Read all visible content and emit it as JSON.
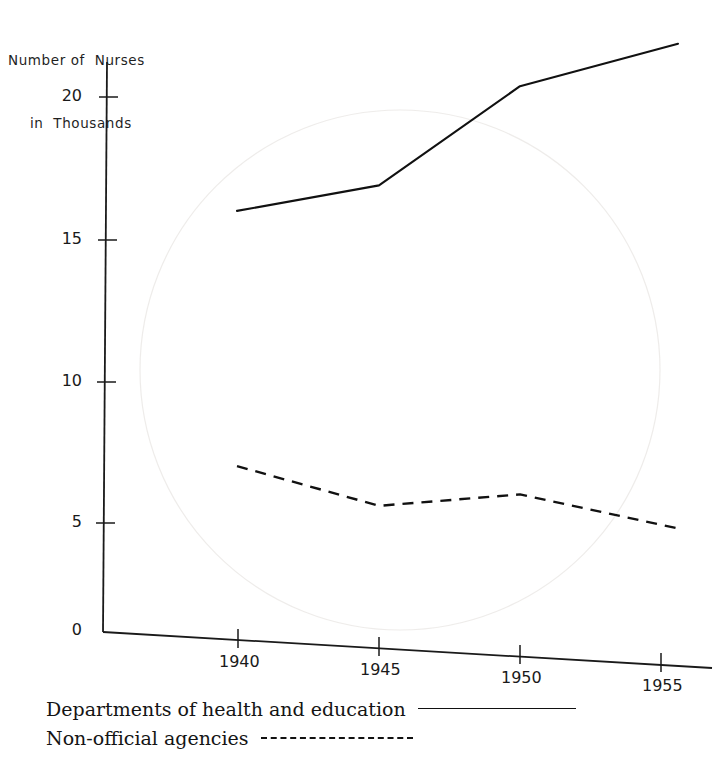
{
  "chart_data": {
    "type": "line",
    "title": "Number of Nurses in Thousands",
    "title_line1": "Number of  Nurses",
    "title_line2": "in  Thousands",
    "xlabel": "",
    "ylabel": "Number of Nurses in Thousands",
    "x": [
      1940,
      1945,
      1950,
      1955
    ],
    "xtick_labels": [
      "1940",
      "1945",
      "1950",
      "1955"
    ],
    "ytick_labels": [
      "0",
      "5",
      "10",
      "15",
      "20"
    ],
    "yticks": [
      0,
      5,
      10,
      15,
      20
    ],
    "xlim": [
      1938.5,
      1956.5
    ],
    "ylim": [
      0,
      22
    ],
    "grid": false,
    "legend_position": "below-axes-left",
    "series": [
      {
        "name": "Departments of health and education",
        "style": "solid",
        "color": "#111111",
        "values": [
          14.8,
          15.7,
          19.2,
          20.7
        ]
      },
      {
        "name": "Non-official agencies",
        "style": "dashed",
        "color": "#111111",
        "values": [
          5.8,
          4.4,
          4.8,
          3.6
        ]
      }
    ]
  },
  "axis_title": {
    "line1": "Number of  Nurses",
    "line2": "in  Thousands"
  },
  "y_axis": {
    "ticks": [
      {
        "label": "20",
        "value": 20
      },
      {
        "label": "15",
        "value": 15
      },
      {
        "label": "10",
        "value": 10
      },
      {
        "label": "5",
        "value": 5
      },
      {
        "label": "0",
        "value": 0
      }
    ]
  },
  "x_axis": {
    "ticks": [
      {
        "label": "1940",
        "value": 1940
      },
      {
        "label": "1945",
        "value": 1945
      },
      {
        "label": "1950",
        "value": 1950
      },
      {
        "label": "1955",
        "value": 1955
      }
    ]
  },
  "legend": {
    "entries": [
      {
        "label": "Departments of health and education",
        "style": "solid"
      },
      {
        "label": "Non-official agencies",
        "style": "dashed"
      }
    ]
  }
}
